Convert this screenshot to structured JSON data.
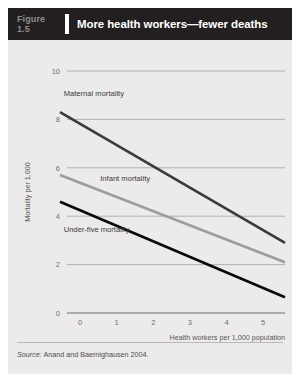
{
  "figure": {
    "number_label": "Figure",
    "number": "1.5",
    "title": "More health workers—fewer deaths",
    "source_label": "Source:",
    "source_text": "Anand and Baernighausen 2004."
  },
  "colors": {
    "header_bg": "#231f20",
    "card_bg": "#eceaea",
    "figure_number": "#8d8c8c",
    "title": "#ffffff",
    "grid": "#9b9b9b",
    "maternal": "#3b3b3b",
    "infant": "#9d9d9d",
    "under_five": "#0a0a0a"
  },
  "chart_data": {
    "type": "line",
    "title": "More health workers—fewer deaths",
    "xlabel": "Health workers per 1,000 population",
    "ylabel": "Mortality per 1,000",
    "xlim": [
      -0.55,
      5.6
    ],
    "ylim": [
      0,
      10
    ],
    "xticks": [
      "0",
      "1",
      "2",
      "3",
      "4",
      "5"
    ],
    "xtick_values": [
      0,
      1,
      2,
      3,
      4,
      5
    ],
    "yticks": [
      "0",
      "2",
      "4",
      "6",
      "8",
      "10"
    ],
    "ytick_values": [
      0,
      2,
      4,
      6,
      8,
      10
    ],
    "grid": "horizontal",
    "legend": "inline-labels",
    "series": [
      {
        "name": "Maternal mortality",
        "label": "Maternal mortality",
        "color": "#3b3b3b",
        "width": 2.6,
        "x": [
          -0.55,
          5.6
        ],
        "values": [
          8.3,
          2.9
        ],
        "label_at": {
          "x": -0.45,
          "y": 8.95
        }
      },
      {
        "name": "Infant mortality",
        "label": "Infant mortality",
        "color": "#9d9d9d",
        "width": 2.6,
        "x": [
          -0.55,
          5.6
        ],
        "values": [
          5.7,
          2.1
        ],
        "label_at": {
          "x": 0.55,
          "y": 5.45
        }
      },
      {
        "name": "Under-five mortality",
        "label": "Under-five mortality",
        "color": "#0a0a0a",
        "width": 2.6,
        "x": [
          -0.55,
          5.6
        ],
        "values": [
          4.6,
          0.65
        ],
        "label_at": {
          "x": -0.45,
          "y": 3.35
        }
      }
    ]
  }
}
